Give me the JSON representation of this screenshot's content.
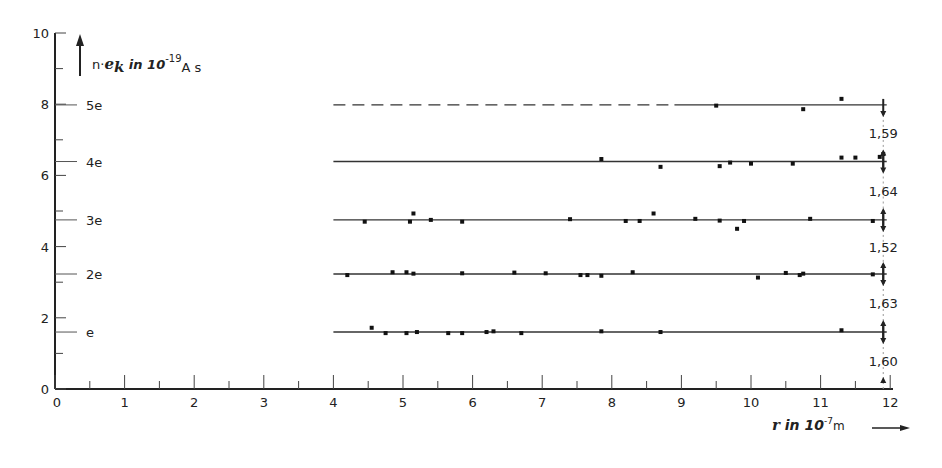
{
  "chart_data": {
    "type": "scatter",
    "title": "",
    "xlabel": {
      "symbol": "r",
      "text": " in 10",
      "exponent": "-7",
      "unit": "m"
    },
    "ylabel": {
      "prefix": "n·",
      "symbol": "e",
      "subscript": "k",
      "text": " in 10",
      "exponent": "-19",
      "unit": "A s"
    },
    "xlim": [
      0,
      12
    ],
    "ylim": [
      0,
      10
    ],
    "x_ticks": [
      "0",
      "1",
      "2",
      "3",
      "4",
      "5",
      "6",
      "7",
      "8",
      "9",
      "10",
      "11",
      "12"
    ],
    "y_ticks": [
      "0",
      "2",
      "4",
      "6",
      "8",
      "10"
    ],
    "grid": false,
    "levels": [
      {
        "label": "e",
        "value": 1.6,
        "style": "solid"
      },
      {
        "label": "2e",
        "value": 3.23,
        "style": "solid"
      },
      {
        "label": "3e",
        "value": 4.75,
        "style": "solid"
      },
      {
        "label": "4e",
        "value": 6.39,
        "style": "solid"
      },
      {
        "label": "5e",
        "value": 7.98,
        "style": "dashed-then-solid",
        "dash_until_x": 8.9
      }
    ],
    "level_differences": [
      {
        "between": "0–e",
        "value": "1,60"
      },
      {
        "between": "e–2e",
        "value": "1,63"
      },
      {
        "between": "2e–3e",
        "value": "1,52"
      },
      {
        "between": "3e–4e",
        "value": "1,64"
      },
      {
        "between": "4e–5e",
        "value": "1,59"
      }
    ],
    "series": [
      {
        "name": "e",
        "points": [
          [
            4.55,
            1.72
          ],
          [
            4.75,
            1.57
          ],
          [
            5.05,
            1.57
          ],
          [
            5.2,
            1.6
          ],
          [
            5.65,
            1.57
          ],
          [
            5.85,
            1.57
          ],
          [
            6.2,
            1.6
          ],
          [
            6.3,
            1.62
          ],
          [
            6.7,
            1.57
          ],
          [
            7.85,
            1.62
          ],
          [
            8.7,
            1.6
          ],
          [
            11.3,
            1.65
          ]
        ]
      },
      {
        "name": "2e",
        "points": [
          [
            4.2,
            3.2
          ],
          [
            4.85,
            3.28
          ],
          [
            5.05,
            3.28
          ],
          [
            5.15,
            3.24
          ],
          [
            5.85,
            3.25
          ],
          [
            6.6,
            3.27
          ],
          [
            7.05,
            3.25
          ],
          [
            7.55,
            3.2
          ],
          [
            7.65,
            3.2
          ],
          [
            7.85,
            3.18
          ],
          [
            8.3,
            3.28
          ],
          [
            10.1,
            3.13
          ],
          [
            10.5,
            3.26
          ],
          [
            10.7,
            3.2
          ],
          [
            10.75,
            3.24
          ],
          [
            11.75,
            3.22
          ]
        ]
      },
      {
        "name": "3e",
        "points": [
          [
            4.45,
            4.7
          ],
          [
            5.1,
            4.7
          ],
          [
            5.15,
            4.93
          ],
          [
            5.4,
            4.75
          ],
          [
            5.85,
            4.7
          ],
          [
            7.4,
            4.77
          ],
          [
            8.2,
            4.72
          ],
          [
            8.4,
            4.72
          ],
          [
            8.6,
            4.93
          ],
          [
            9.2,
            4.78
          ],
          [
            9.55,
            4.73
          ],
          [
            9.8,
            4.5
          ],
          [
            9.9,
            4.72
          ],
          [
            10.85,
            4.78
          ],
          [
            11.75,
            4.72
          ]
        ]
      },
      {
        "name": "4e",
        "points": [
          [
            7.85,
            6.46
          ],
          [
            8.7,
            6.24
          ],
          [
            9.55,
            6.26
          ],
          [
            9.7,
            6.36
          ],
          [
            10.0,
            6.33
          ],
          [
            10.6,
            6.33
          ],
          [
            11.3,
            6.5
          ],
          [
            11.5,
            6.5
          ],
          [
            11.85,
            6.52
          ],
          [
            11.9,
            6.6
          ]
        ]
      },
      {
        "name": "5e",
        "points": [
          [
            9.5,
            7.96
          ],
          [
            10.75,
            7.86
          ],
          [
            11.3,
            8.15
          ]
        ]
      }
    ]
  }
}
